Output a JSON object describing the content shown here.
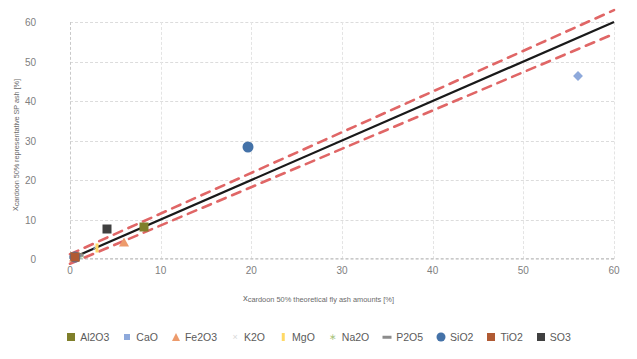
{
  "chart_data": {
    "type": "scatter",
    "title": "",
    "xlabel": "x_cardoon 50% theoretical fly ash amounts [%]",
    "xlabel_main": "x",
    "xlabel_sub": "cardoon 50% theoretical fly ash amounts [%]",
    "ylabel": "x_cardoon 50% representative SP ash [%]",
    "ylabel_main": "x",
    "ylabel_sub": "cardoon 50% representative SP ash [%]",
    "xlim": [
      0,
      60
    ],
    "ylim": [
      0,
      60
    ],
    "xticks": [
      0,
      10,
      20,
      30,
      40,
      50,
      60
    ],
    "yticks": [
      0,
      10,
      20,
      30,
      40,
      50,
      60
    ],
    "grid": true,
    "legend_position": "bottom",
    "series": [
      {
        "name": "Al2O3",
        "marker": "square",
        "color": "#7f7f2a",
        "points": [
          [
            0.6,
            0.6
          ],
          [
            8.2,
            8.0
          ]
        ]
      },
      {
        "name": "CaO",
        "marker": "diamond",
        "color": "#8ea9db",
        "points": [
          [
            0.5,
            0.5
          ],
          [
            56.0,
            46.3
          ]
        ]
      },
      {
        "name": "Fe2O3",
        "marker": "triangle",
        "color": "#ed9b6c",
        "points": [
          [
            0.4,
            0.4
          ],
          [
            6.0,
            4.3
          ]
        ]
      },
      {
        "name": "K2O",
        "marker": "x",
        "color": "#d9d9d9",
        "points": [
          [
            0.4,
            0.4
          ],
          [
            2.8,
            3.0
          ]
        ]
      },
      {
        "name": "MgO",
        "marker": "bar",
        "color": "#ffd966",
        "points": [
          [
            0.4,
            0.4
          ],
          [
            3.0,
            2.9
          ]
        ]
      },
      {
        "name": "Na2O",
        "marker": "star",
        "color": "#a9c47f",
        "points": [
          [
            0.4,
            0.4
          ],
          [
            1.2,
            1.1
          ]
        ]
      },
      {
        "name": "P2O5",
        "marker": "dash",
        "color": "#8c8c8c",
        "points": [
          [
            0.4,
            0.4
          ],
          [
            1.0,
            1.0
          ]
        ]
      },
      {
        "name": "SiO2",
        "marker": "circle",
        "color": "#4472a8",
        "points": [
          [
            0.6,
            0.6
          ],
          [
            19.6,
            28.4
          ]
        ]
      },
      {
        "name": "TiO2",
        "marker": "square",
        "color": "#b05a33",
        "points": [
          [
            0.5,
            0.5
          ]
        ]
      },
      {
        "name": "SO3",
        "marker": "square",
        "color": "#404040",
        "points": [
          [
            4.1,
            7.5
          ]
        ]
      }
    ],
    "trend_line": {
      "name": "regression-line",
      "color": "#1a1a1a",
      "from": [
        0,
        0
      ],
      "to": [
        60,
        60
      ]
    },
    "confidence_bands": {
      "name": "confidence-interval",
      "color": "#e06666",
      "style": "dashed",
      "upper_from": [
        0,
        1.2
      ],
      "upper_to": [
        60,
        63.0
      ],
      "lower_from": [
        0,
        -1.2
      ],
      "lower_to": [
        60,
        57.0
      ]
    }
  },
  "legend": {
    "items": [
      {
        "label": "Al2O3",
        "marker": "square",
        "color": "#7f7f2a"
      },
      {
        "label": "CaO",
        "marker": "diamond",
        "color": "#8ea9db"
      },
      {
        "label": "Fe2O3",
        "marker": "triangle",
        "color": "#ed9b6c"
      },
      {
        "label": "K2O",
        "marker": "x",
        "color": "#d9d9d9"
      },
      {
        "label": "MgO",
        "marker": "bar",
        "color": "#ffd966"
      },
      {
        "label": "Na2O",
        "marker": "star",
        "color": "#a9c47f"
      },
      {
        "label": "P2O5",
        "marker": "dash",
        "color": "#8c8c8c"
      },
      {
        "label": "SiO2",
        "marker": "circle",
        "color": "#4472a8"
      },
      {
        "label": "TiO2",
        "marker": "square",
        "color": "#b05a33"
      },
      {
        "label": "SO3",
        "marker": "square",
        "color": "#404040"
      }
    ]
  },
  "colors": {
    "grid": "#dcdcdc",
    "tick_text": "#808080",
    "axis_title": "#6b6b6b",
    "trend": "#1a1a1a",
    "band": "#e06666",
    "background": "#ffffff"
  }
}
